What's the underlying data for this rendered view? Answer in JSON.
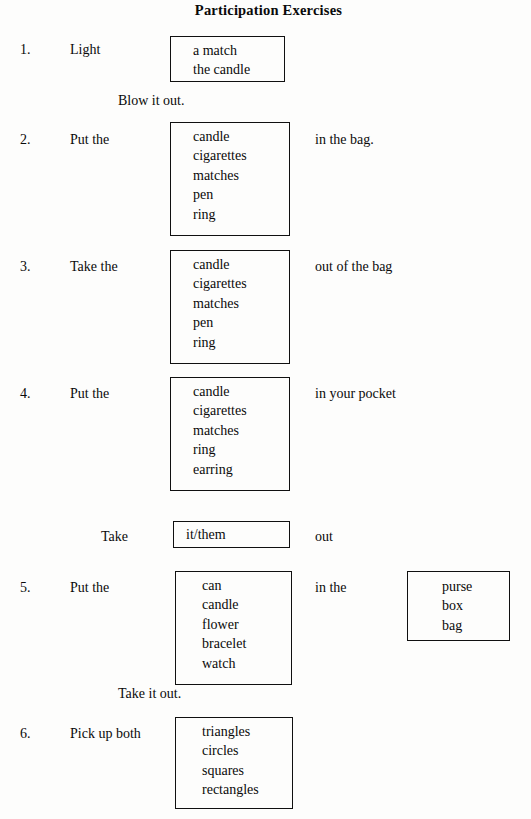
{
  "document": {
    "title": "Participation Exercises"
  },
  "exercises": [
    {
      "number": "1.",
      "stem": "Light",
      "options": [
        "a match",
        "the candle"
      ],
      "tail": "",
      "note": "Blow it out."
    },
    {
      "number": "2.",
      "stem": "Put the",
      "options": [
        "candle",
        "cigarettes",
        "matches",
        "pen",
        "ring"
      ],
      "tail": "in the bag.",
      "note": ""
    },
    {
      "number": "3.",
      "stem": "Take the",
      "options": [
        "candle",
        "cigarettes",
        "matches",
        "pen",
        "ring"
      ],
      "tail": "out of the bag",
      "note": ""
    },
    {
      "number": "4.",
      "stem": "Put the",
      "options": [
        "candle",
        "cigarettes",
        "matches",
        "ring",
        "earring"
      ],
      "tail": "in your pocket",
      "note": "",
      "followup": {
        "stem": "Take",
        "options": [
          "it/them"
        ],
        "tail": "out"
      }
    },
    {
      "number": "5.",
      "stem": "Put the",
      "options": [
        "can",
        "candle",
        "flower",
        "bracelet",
        "watch"
      ],
      "tail": "in the",
      "options2": [
        "purse",
        "box",
        "bag"
      ],
      "note": "Take it out."
    },
    {
      "number": "6.",
      "stem": "Pick up both",
      "options": [
        "triangles",
        "circles",
        "squares",
        "rectangles"
      ],
      "tail": "",
      "note": ""
    }
  ]
}
